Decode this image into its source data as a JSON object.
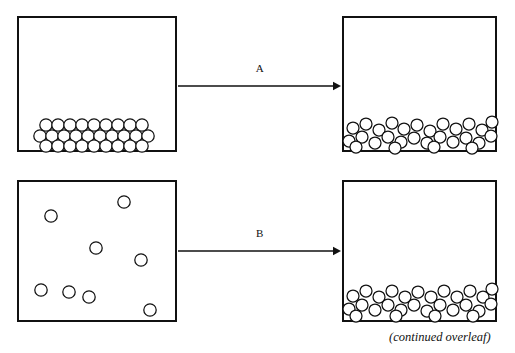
{
  "figure": {
    "width": 515,
    "height": 353,
    "background": "#ffffff",
    "ink_color": "#111111",
    "caption": "(continued overleaf)"
  },
  "panels": [
    {
      "id": "panel-solid",
      "name": "top-left-container",
      "role": "ordered close-packed arrangement",
      "x": 17,
      "y": 16,
      "width": 160,
      "height": 136,
      "particle_radius": 6.2,
      "particle_count": 28,
      "particles": [
        {
          "cx": 46,
          "cy": 125
        },
        {
          "cx": 58,
          "cy": 125
        },
        {
          "cx": 70,
          "cy": 125
        },
        {
          "cx": 82,
          "cy": 125
        },
        {
          "cx": 94,
          "cy": 125
        },
        {
          "cx": 106,
          "cy": 125
        },
        {
          "cx": 118,
          "cy": 125
        },
        {
          "cx": 130,
          "cy": 125
        },
        {
          "cx": 142,
          "cy": 125
        },
        {
          "cx": 40,
          "cy": 136
        },
        {
          "cx": 52,
          "cy": 136
        },
        {
          "cx": 64,
          "cy": 136
        },
        {
          "cx": 76,
          "cy": 136
        },
        {
          "cx": 88,
          "cy": 136
        },
        {
          "cx": 100,
          "cy": 136
        },
        {
          "cx": 112,
          "cy": 136
        },
        {
          "cx": 124,
          "cy": 136
        },
        {
          "cx": 136,
          "cy": 136
        },
        {
          "cx": 148,
          "cy": 136
        },
        {
          "cx": 46,
          "cy": 146
        },
        {
          "cx": 58,
          "cy": 146
        },
        {
          "cx": 70,
          "cy": 146
        },
        {
          "cx": 82,
          "cy": 146
        },
        {
          "cx": 94,
          "cy": 146
        },
        {
          "cx": 106,
          "cy": 146
        },
        {
          "cx": 118,
          "cy": 146
        },
        {
          "cx": 130,
          "cy": 146
        },
        {
          "cx": 142,
          "cy": 146
        }
      ]
    },
    {
      "id": "panel-liquid-a",
      "name": "top-right-container",
      "role": "disordered settled arrangement",
      "x": 342,
      "y": 16,
      "width": 155,
      "height": 136,
      "particle_radius": 6.0,
      "particle_count": 28,
      "particles": [
        {
          "cx": 353,
          "cy": 128
        },
        {
          "cx": 366,
          "cy": 124
        },
        {
          "cx": 379,
          "cy": 130
        },
        {
          "cx": 392,
          "cy": 123
        },
        {
          "cx": 404,
          "cy": 129
        },
        {
          "cx": 417,
          "cy": 125
        },
        {
          "cx": 430,
          "cy": 131
        },
        {
          "cx": 443,
          "cy": 124
        },
        {
          "cx": 456,
          "cy": 129
        },
        {
          "cx": 469,
          "cy": 124
        },
        {
          "cx": 482,
          "cy": 130
        },
        {
          "cx": 492,
          "cy": 122
        },
        {
          "cx": 349,
          "cy": 141
        },
        {
          "cx": 362,
          "cy": 137
        },
        {
          "cx": 375,
          "cy": 143
        },
        {
          "cx": 388,
          "cy": 137
        },
        {
          "cx": 401,
          "cy": 142
        },
        {
          "cx": 414,
          "cy": 138
        },
        {
          "cx": 427,
          "cy": 143
        },
        {
          "cx": 440,
          "cy": 137
        },
        {
          "cx": 453,
          "cy": 142
        },
        {
          "cx": 466,
          "cy": 138
        },
        {
          "cx": 479,
          "cy": 143
        },
        {
          "cx": 491,
          "cy": 136
        },
        {
          "cx": 356,
          "cy": 147
        },
        {
          "cx": 395,
          "cy": 148
        },
        {
          "cx": 434,
          "cy": 147
        },
        {
          "cx": 472,
          "cy": 148
        }
      ]
    },
    {
      "id": "panel-gas",
      "name": "bottom-left-container",
      "role": "widely dispersed arrangement",
      "x": 17,
      "y": 180,
      "width": 160,
      "height": 142,
      "particle_radius": 6.2,
      "particle_count": 8,
      "particles": [
        {
          "cx": 51,
          "cy": 216
        },
        {
          "cx": 124,
          "cy": 202
        },
        {
          "cx": 96,
          "cy": 248
        },
        {
          "cx": 141,
          "cy": 260
        },
        {
          "cx": 69,
          "cy": 292
        },
        {
          "cx": 89,
          "cy": 297
        },
        {
          "cx": 150,
          "cy": 310
        },
        {
          "cx": 41,
          "cy": 290
        }
      ]
    },
    {
      "id": "panel-liquid-b",
      "name": "bottom-right-container",
      "role": "disordered settled arrangement",
      "x": 342,
      "y": 180,
      "width": 155,
      "height": 142,
      "particle_radius": 6.0,
      "particle_count": 28,
      "particles": [
        {
          "cx": 353,
          "cy": 296
        },
        {
          "cx": 366,
          "cy": 291
        },
        {
          "cx": 379,
          "cy": 297
        },
        {
          "cx": 392,
          "cy": 291
        },
        {
          "cx": 405,
          "cy": 297
        },
        {
          "cx": 418,
          "cy": 292
        },
        {
          "cx": 431,
          "cy": 297
        },
        {
          "cx": 444,
          "cy": 291
        },
        {
          "cx": 457,
          "cy": 297
        },
        {
          "cx": 470,
          "cy": 291
        },
        {
          "cx": 483,
          "cy": 297
        },
        {
          "cx": 492,
          "cy": 289
        },
        {
          "cx": 349,
          "cy": 309
        },
        {
          "cx": 362,
          "cy": 305
        },
        {
          "cx": 375,
          "cy": 310
        },
        {
          "cx": 388,
          "cy": 305
        },
        {
          "cx": 401,
          "cy": 310
        },
        {
          "cx": 414,
          "cy": 305
        },
        {
          "cx": 427,
          "cy": 311
        },
        {
          "cx": 440,
          "cy": 305
        },
        {
          "cx": 453,
          "cy": 310
        },
        {
          "cx": 466,
          "cy": 305
        },
        {
          "cx": 479,
          "cy": 311
        },
        {
          "cx": 491,
          "cy": 304
        },
        {
          "cx": 356,
          "cy": 316
        },
        {
          "cx": 396,
          "cy": 316
        },
        {
          "cx": 435,
          "cy": 316
        },
        {
          "cx": 473,
          "cy": 316
        }
      ]
    }
  ],
  "arrows": [
    {
      "id": "arrow-a",
      "label": "A",
      "from_panel": "panel-solid",
      "to_panel": "panel-liquid-a",
      "x1": 178,
      "y1": 86,
      "x2": 341,
      "y2": 86,
      "label_x": 260,
      "label_y": 62
    },
    {
      "id": "arrow-b",
      "label": "B",
      "from_panel": "panel-gas",
      "to_panel": "panel-liquid-b",
      "x1": 178,
      "y1": 251,
      "x2": 341,
      "y2": 251,
      "label_x": 260,
      "label_y": 227
    }
  ],
  "caption_block": {
    "text": "(continued overleaf)",
    "x": 389,
    "y": 330
  }
}
